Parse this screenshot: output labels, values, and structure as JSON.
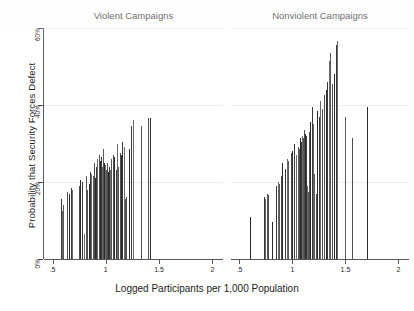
{
  "chart_data": {
    "type": "bar",
    "title": "",
    "subtitle": "",
    "xlabel": "Logged Participants per 1,000 Population",
    "ylabel": "Probability that Security Forces Defect",
    "xlim": [
      0.42,
      2.1
    ],
    "ylim": [
      0,
      60
    ],
    "xticks": [
      ".5",
      "1",
      "1.5",
      "2"
    ],
    "xtick_values": [
      0.5,
      1.0,
      1.5,
      2.0
    ],
    "yticks": [
      "0%",
      "20%",
      "40%",
      "60%"
    ],
    "ytick_values": [
      0,
      20,
      40,
      60
    ],
    "grid": "horizontal",
    "legend": "none",
    "bar_color": "#3c3c3c",
    "axis_color": "#55595c",
    "gridline_color": "#ededf0",
    "background": "#ffffff",
    "panels": [
      {
        "name": "violent",
        "title": "Violent Campaigns",
        "points": [
          {
            "x": 0.575,
            "y": 15.5
          },
          {
            "x": 0.585,
            "y": 12.5
          },
          {
            "x": 0.6,
            "y": 14.0
          },
          {
            "x": 0.635,
            "y": 17.5
          },
          {
            "x": 0.655,
            "y": 17.0
          },
          {
            "x": 0.672,
            "y": 18.5
          },
          {
            "x": 0.684,
            "y": 18.0
          },
          {
            "x": 0.745,
            "y": 9.0
          },
          {
            "x": 0.752,
            "y": 19.0
          },
          {
            "x": 0.762,
            "y": 20.5
          },
          {
            "x": 0.775,
            "y": 20.0
          },
          {
            "x": 0.8,
            "y": 6.5
          },
          {
            "x": 0.812,
            "y": 21.5
          },
          {
            "x": 0.826,
            "y": 18.0
          },
          {
            "x": 0.838,
            "y": 19.5
          },
          {
            "x": 0.85,
            "y": 22.5
          },
          {
            "x": 0.862,
            "y": 22.0
          },
          {
            "x": 0.878,
            "y": 21.5
          },
          {
            "x": 0.89,
            "y": 25.0
          },
          {
            "x": 0.9,
            "y": 21.0
          },
          {
            "x": 0.912,
            "y": 24.0
          },
          {
            "x": 0.922,
            "y": 26.0
          },
          {
            "x": 0.932,
            "y": 24.5
          },
          {
            "x": 0.94,
            "y": 27.0
          },
          {
            "x": 0.948,
            "y": 25.5
          },
          {
            "x": 0.956,
            "y": 26.5
          },
          {
            "x": 0.963,
            "y": 24.0
          },
          {
            "x": 0.97,
            "y": 28.5
          },
          {
            "x": 0.977,
            "y": 26.0
          },
          {
            "x": 0.983,
            "y": 25.0
          },
          {
            "x": 0.99,
            "y": 23.5
          },
          {
            "x": 0.996,
            "y": 24.5
          },
          {
            "x": 1.002,
            "y": 23.0
          },
          {
            "x": 1.01,
            "y": 25.0
          },
          {
            "x": 1.018,
            "y": 22.5
          },
          {
            "x": 1.028,
            "y": 24.0
          },
          {
            "x": 1.04,
            "y": 23.0
          },
          {
            "x": 1.052,
            "y": 26.0
          },
          {
            "x": 1.065,
            "y": 27.0
          },
          {
            "x": 1.08,
            "y": 26.5
          },
          {
            "x": 1.092,
            "y": 23.0
          },
          {
            "x": 1.105,
            "y": 30.0
          },
          {
            "x": 1.118,
            "y": 24.0
          },
          {
            "x": 1.13,
            "y": 27.5
          },
          {
            "x": 1.142,
            "y": 27.0
          },
          {
            "x": 1.155,
            "y": 30.5
          },
          {
            "x": 1.168,
            "y": 29.0
          },
          {
            "x": 1.18,
            "y": 15.5
          },
          {
            "x": 1.192,
            "y": 16.0
          },
          {
            "x": 1.215,
            "y": 28.5
          },
          {
            "x": 1.24,
            "y": 34.5
          },
          {
            "x": 1.252,
            "y": 36.0
          },
          {
            "x": 1.33,
            "y": 34.5
          },
          {
            "x": 1.395,
            "y": 36.5
          },
          {
            "x": 1.412,
            "y": 36.5
          }
        ]
      },
      {
        "name": "nonviolent",
        "title": "Nonviolent Campaigns",
        "points": [
          {
            "x": 0.6,
            "y": 11.0
          },
          {
            "x": 0.73,
            "y": 16.0
          },
          {
            "x": 0.742,
            "y": 15.5
          },
          {
            "x": 0.76,
            "y": 17.0
          },
          {
            "x": 0.772,
            "y": 16.5
          },
          {
            "x": 0.81,
            "y": 9.5
          },
          {
            "x": 0.848,
            "y": 19.0
          },
          {
            "x": 0.86,
            "y": 20.0
          },
          {
            "x": 0.875,
            "y": 19.5
          },
          {
            "x": 0.892,
            "y": 21.5
          },
          {
            "x": 0.905,
            "y": 25.0
          },
          {
            "x": 0.928,
            "y": 23.5
          },
          {
            "x": 0.945,
            "y": 26.0
          },
          {
            "x": 0.962,
            "y": 25.5
          },
          {
            "x": 0.985,
            "y": 27.5
          },
          {
            "x": 1.0,
            "y": 28.0
          },
          {
            "x": 1.018,
            "y": 30.0
          },
          {
            "x": 1.032,
            "y": 27.0
          },
          {
            "x": 1.048,
            "y": 29.0
          },
          {
            "x": 1.06,
            "y": 28.5
          },
          {
            "x": 1.072,
            "y": 31.5
          },
          {
            "x": 1.084,
            "y": 30.5
          },
          {
            "x": 1.094,
            "y": 32.0
          },
          {
            "x": 1.104,
            "y": 31.5
          },
          {
            "x": 1.112,
            "y": 33.5
          },
          {
            "x": 1.12,
            "y": 32.5
          },
          {
            "x": 1.128,
            "y": 32.0
          },
          {
            "x": 1.136,
            "y": 19.0
          },
          {
            "x": 1.144,
            "y": 17.5
          },
          {
            "x": 1.155,
            "y": 33.0
          },
          {
            "x": 1.168,
            "y": 35.5
          },
          {
            "x": 1.18,
            "y": 39.5
          },
          {
            "x": 1.192,
            "y": 35.0
          },
          {
            "x": 1.205,
            "y": 22.0
          },
          {
            "x": 1.218,
            "y": 17.0
          },
          {
            "x": 1.232,
            "y": 38.5
          },
          {
            "x": 1.248,
            "y": 37.0
          },
          {
            "x": 1.262,
            "y": 41.0
          },
          {
            "x": 1.278,
            "y": 39.0
          },
          {
            "x": 1.295,
            "y": 42.5
          },
          {
            "x": 1.312,
            "y": 44.0
          },
          {
            "x": 1.328,
            "y": 46.0
          },
          {
            "x": 1.345,
            "y": 51.5
          },
          {
            "x": 1.358,
            "y": 53.5
          },
          {
            "x": 1.372,
            "y": 45.5
          },
          {
            "x": 1.39,
            "y": 48.0
          },
          {
            "x": 1.408,
            "y": 55.5
          },
          {
            "x": 1.422,
            "y": 56.5
          },
          {
            "x": 1.495,
            "y": 37.0
          },
          {
            "x": 1.56,
            "y": 31.5
          },
          {
            "x": 1.705,
            "y": 39.5
          }
        ]
      }
    ]
  },
  "axes": {
    "ytitle": "Probability that Security Forces Defect",
    "xtitle": "Logged Participants per 1,000 Population"
  }
}
